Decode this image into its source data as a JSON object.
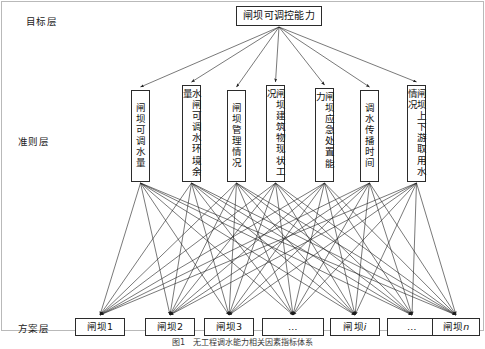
{
  "diagram": {
    "type": "hierarchy-network",
    "layers": [
      {
        "key": "goal",
        "label": "目标层"
      },
      {
        "key": "criteria",
        "label": "准则层"
      },
      {
        "key": "alternatives",
        "label": "方案层"
      }
    ],
    "goal": {
      "label": "闸坝可调控能力",
      "x": 236,
      "y": 6,
      "w": 86,
      "h": 20
    },
    "criteria": [
      {
        "label": "闸坝可调水量",
        "x": 131,
        "y": 90,
        "w": 19,
        "h": 92
      },
      {
        "label": "水闸可调水环境余量",
        "x": 182,
        "y": 85,
        "w": 19,
        "h": 97
      },
      {
        "label": "闸坝管理情况",
        "x": 227,
        "y": 90,
        "w": 19,
        "h": 92
      },
      {
        "label": "闸坝建筑物现状工况",
        "x": 266,
        "y": 85,
        "w": 19,
        "h": 97
      },
      {
        "label": "闸坝应急处置能力",
        "x": 315,
        "y": 88,
        "w": 19,
        "h": 94
      },
      {
        "label": "调水传播时间",
        "x": 360,
        "y": 90,
        "w": 19,
        "h": 92
      },
      {
        "label": "闸坝上下游取用水情况",
        "x": 407,
        "y": 85,
        "w": 19,
        "h": 97
      }
    ],
    "alternatives": [
      {
        "label": "闸坝1",
        "italicTail": "",
        "x": 75,
        "y": 318,
        "w": 50,
        "h": 18
      },
      {
        "label": "闸坝2",
        "italicTail": "",
        "x": 145,
        "y": 318,
        "w": 50,
        "h": 18
      },
      {
        "label": "闸坝3",
        "italicTail": "",
        "x": 204,
        "y": 318,
        "w": 50,
        "h": 18
      },
      {
        "label": "…",
        "italicTail": "",
        "x": 262,
        "y": 318,
        "w": 62,
        "h": 18
      },
      {
        "label": "闸坝",
        "italicTail": "i",
        "x": 330,
        "y": 318,
        "w": 50,
        "h": 18
      },
      {
        "label": "…",
        "italicTail": "",
        "x": 387,
        "y": 318,
        "w": 50,
        "h": 18
      },
      {
        "label": "闸坝",
        "italicTail": "n",
        "x": 432,
        "y": 318,
        "w": 48,
        "h": 18
      }
    ],
    "caption": "图1　无工程调水能力相关因素指标体系",
    "colors": {
      "stroke": "#2b2b2b",
      "edge": "#1f1f1f",
      "frame": "#b9b9b9",
      "text": "#111111",
      "background": "#ffffff"
    },
    "label_positions": {
      "goal": {
        "x": 26,
        "y": 14
      },
      "criteria": {
        "x": 18,
        "y": 134
      },
      "alternatives": {
        "x": 18,
        "y": 321
      }
    }
  }
}
